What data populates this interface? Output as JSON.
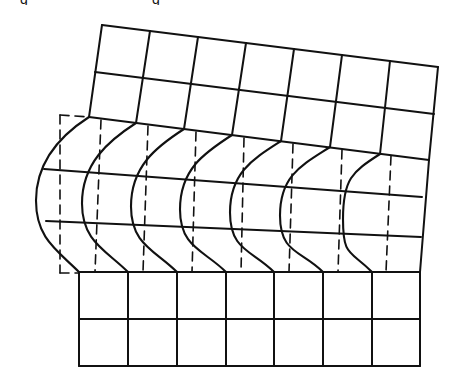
{
  "figure": {
    "caption_fragments": [
      {
        "text": "g",
        "x": 20
      },
      {
        "text": "g",
        "x": 152
      }
    ],
    "colors": {
      "line": "#111111",
      "background": "#ffffff"
    }
  },
  "upper_block": {
    "rows": [
      {
        "name": "top-edge",
        "from": [
          102,
          25
        ],
        "to": [
          438,
          67
        ]
      },
      {
        "name": "middle-line",
        "from": [
          95,
          72
        ],
        "to": [
          434,
          114
        ]
      },
      {
        "name": "shear-top-boundary",
        "from": [
          89,
          117
        ],
        "to": [
          429,
          160
        ]
      }
    ],
    "columns": [
      {
        "top": [
          102,
          25
        ],
        "bottom": [
          89,
          117
        ]
      },
      {
        "top": [
          150,
          31
        ],
        "bottom": [
          136,
          123
        ]
      },
      {
        "top": [
          198,
          37
        ],
        "bottom": [
          184,
          129
        ]
      },
      {
        "top": [
          246,
          43
        ],
        "bottom": [
          232,
          135
        ]
      },
      {
        "top": [
          294,
          49
        ],
        "bottom": [
          281,
          141
        ]
      },
      {
        "top": [
          342,
          55
        ],
        "bottom": [
          330,
          147
        ]
      },
      {
        "top": [
          390,
          61
        ],
        "bottom": [
          380,
          154
        ]
      },
      {
        "top": [
          438,
          67
        ],
        "bottom": [
          429,
          160
        ]
      }
    ]
  },
  "shear_zone": {
    "right_edge": {
      "from": [
        429,
        160
      ],
      "to": [
        420,
        272
      ]
    },
    "inner_lines": [
      {
        "name": "upper-inner",
        "from": [
          44,
          169
        ],
        "to": [
          422,
          197
        ]
      },
      {
        "name": "lower-inner",
        "from": [
          46,
          221
        ],
        "to": [
          421,
          237
        ]
      }
    ],
    "bottom_boundary": {
      "from": [
        79,
        272
      ],
      "to": [
        420,
        272
      ]
    },
    "curves": [
      {
        "top": [
          89,
          117
        ],
        "bulge_x": 36,
        "bottom": [
          79,
          272
        ]
      },
      {
        "top": [
          136,
          123
        ],
        "bulge_x": 82,
        "bottom": [
          128,
          272
        ]
      },
      {
        "top": [
          184,
          129
        ],
        "bulge_x": 131,
        "bottom": [
          177,
          272
        ]
      },
      {
        "top": [
          232,
          135
        ],
        "bulge_x": 180,
        "bottom": [
          226,
          272
        ]
      },
      {
        "top": [
          281,
          141
        ],
        "bulge_x": 230,
        "bottom": [
          274,
          272
        ]
      },
      {
        "top": [
          330,
          147
        ],
        "bulge_x": 280,
        "bottom": [
          323,
          272
        ]
      },
      {
        "top": [
          380,
          154
        ],
        "bulge_x": 343,
        "bottom": [
          372,
          272
        ]
      }
    ],
    "dashed_reference": [
      {
        "from": [
          60,
          115
        ],
        "to": [
          60,
          273
        ]
      },
      {
        "from": [
          101,
          120
        ],
        "to": [
          95,
          272
        ]
      },
      {
        "from": [
          148,
          126
        ],
        "to": [
          143,
          272
        ]
      },
      {
        "from": [
          196,
          132
        ],
        "to": [
          192,
          272
        ]
      },
      {
        "from": [
          244,
          138
        ],
        "to": [
          241,
          272
        ]
      },
      {
        "from": [
          293,
          144
        ],
        "to": [
          289,
          272
        ]
      },
      {
        "from": [
          342,
          150
        ],
        "to": [
          338,
          272
        ]
      },
      {
        "from": [
          391,
          156
        ],
        "to": [
          386,
          272
        ]
      }
    ],
    "dashed_frame": {
      "top": {
        "from": [
          60,
          115
        ],
        "to": [
          89,
          117
        ]
      },
      "bottom": {
        "from": [
          60,
          273
        ],
        "to": [
          79,
          273
        ]
      }
    }
  },
  "lower_block": {
    "rows": [
      {
        "name": "top-edge",
        "from": [
          79,
          272
        ],
        "to": [
          420,
          272
        ]
      },
      {
        "name": "middle-line",
        "from": [
          79,
          319
        ],
        "to": [
          420,
          319
        ]
      },
      {
        "name": "bottom-edge",
        "from": [
          79,
          366
        ],
        "to": [
          420,
          366
        ]
      }
    ],
    "column_x": [
      79,
      128,
      177,
      226,
      274,
      323,
      372,
      420
    ],
    "top_y": 272,
    "bottom_y": 366
  }
}
